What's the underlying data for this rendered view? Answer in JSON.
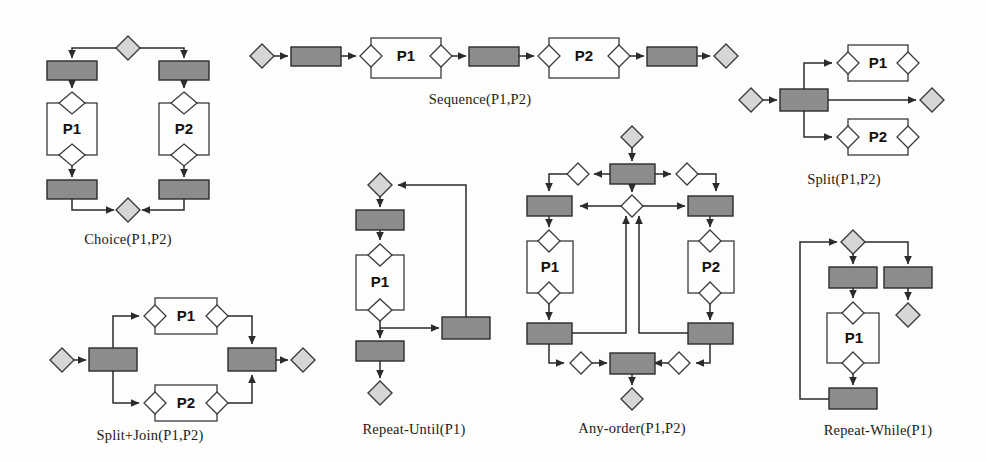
{
  "figure": {
    "background_color": "#fdfdfb",
    "colors": {
      "task_fill": "#8c8c8c",
      "terminal_fill": "#d6d6d6",
      "gateway_fill": "#ffffff",
      "stroke": "#3a3a3a",
      "text": "#1a1a1a"
    },
    "process_labels": {
      "p1": "P1",
      "p2": "P2"
    }
  },
  "diagrams": [
    {
      "id": "choice",
      "caption": "Choice(P1,P2)",
      "pattern_type": "choice",
      "subprocesses": [
        "P1",
        "P2"
      ],
      "nodes": {
        "start_terminal": 1,
        "end_terminal": 1,
        "tasks": 4,
        "gateways": 4
      }
    },
    {
      "id": "sequence",
      "caption": "Sequence(P1,P2)",
      "pattern_type": "sequence",
      "subprocesses": [
        "P1",
        "P2"
      ],
      "nodes": {
        "start_terminal": 1,
        "end_terminal": 1,
        "tasks": 3,
        "gateways": 4
      }
    },
    {
      "id": "split",
      "caption": "Split(P1,P2)",
      "pattern_type": "split",
      "subprocesses": [
        "P1",
        "P2"
      ],
      "nodes": {
        "start_terminal": 1,
        "end_terminal": 1,
        "tasks": 1,
        "gateways": 4
      }
    },
    {
      "id": "split-join",
      "caption": "Split+Join(P1,P2)",
      "pattern_type": "split-join",
      "subprocesses": [
        "P1",
        "P2"
      ],
      "nodes": {
        "start_terminal": 1,
        "end_terminal": 1,
        "tasks": 2,
        "gateways": 4
      }
    },
    {
      "id": "repeat-until",
      "caption": "Repeat-Until(P1)",
      "pattern_type": "repeat-until",
      "subprocesses": [
        "P1"
      ],
      "nodes": {
        "start_terminal": 1,
        "end_terminal": 1,
        "tasks": 3,
        "gateways": 2
      }
    },
    {
      "id": "any-order",
      "caption": "Any-order(P1,P2)",
      "pattern_type": "any-order",
      "subprocesses": [
        "P1",
        "P2"
      ],
      "nodes": {
        "start_terminal": 1,
        "end_terminal": 1,
        "tasks": 6,
        "gateways": 8
      }
    },
    {
      "id": "repeat-while",
      "caption": "Repeat-While(P1)",
      "pattern_type": "repeat-while",
      "subprocesses": [
        "P1"
      ],
      "nodes": {
        "start_terminal": 1,
        "end_terminal": 1,
        "tasks": 3,
        "gateways": 2
      }
    }
  ]
}
